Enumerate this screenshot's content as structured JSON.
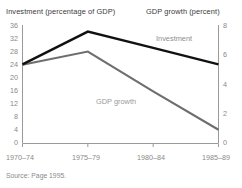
{
  "figure": {
    "source_note": "Source: Page 1995.",
    "left_axis_title": "Investment (percentage of GDP)",
    "right_axis_title": "GDP growth (percent)"
  },
  "chart_data": {
    "type": "line",
    "title": "",
    "subtitle": "",
    "xlabel": "",
    "ylabel": "Investment (percentage of GDP)",
    "y2label": "GDP growth (percent)",
    "categories": [
      "1970–74",
      "1975–79",
      "1980–84",
      "1985–89"
    ],
    "x_tick_labels": [
      "1970–74",
      "1975–79",
      "1980–84",
      "1985–89"
    ],
    "left_axis": {
      "label": "Investment (percentage of GDP)",
      "ylim": [
        0,
        36
      ],
      "ticks": [
        0,
        4,
        8,
        12,
        16,
        20,
        24,
        28,
        32,
        36
      ],
      "tick_labels": [
        "0",
        "4",
        "8",
        "12",
        "16",
        "20",
        "24",
        "28",
        "32",
        "36"
      ]
    },
    "right_axis": {
      "label": "GDP growth (percent)",
      "ylim": [
        0,
        8
      ],
      "ticks": [
        0,
        2,
        4,
        6,
        8
      ],
      "tick_labels": [
        "0",
        "2",
        "4",
        "6",
        "8"
      ]
    },
    "grid": false,
    "legend": "inline-annotations",
    "series": [
      {
        "name": "Investment",
        "axis": "left",
        "color": "#111111",
        "units": "percentage of GDP",
        "values": [
          24,
          34,
          29,
          24
        ]
      },
      {
        "name": "GDP growth",
        "axis": "right",
        "color": "#6e6e6e",
        "units": "percent",
        "values": [
          5.3,
          6.2,
          3.5,
          0.9
        ]
      }
    ],
    "annotations": [
      {
        "text": "Investment",
        "series": "Investment"
      },
      {
        "text": "GDP growth",
        "series": "GDP growth"
      }
    ]
  }
}
